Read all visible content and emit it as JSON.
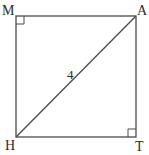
{
  "diagram": {
    "type": "geometry-square-with-diagonal",
    "vertices": [
      {
        "name": "M",
        "label": "M",
        "x": 16,
        "y": 16,
        "label_x": 3,
        "label_y": 15
      },
      {
        "name": "A",
        "label": "A",
        "x": 136,
        "y": 16,
        "label_x": 138,
        "label_y": 15
      },
      {
        "name": "H",
        "label": "H",
        "x": 16,
        "y": 137,
        "label_x": 5,
        "label_y": 150
      },
      {
        "name": "T",
        "label": "T",
        "x": 136,
        "y": 137,
        "label_x": 136,
        "label_y": 151
      }
    ],
    "sides": [
      "MA",
      "AT",
      "TH",
      "HM"
    ],
    "diagonal": {
      "from": "H",
      "to": "A",
      "length_label": "4",
      "label_x": 67,
      "label_y": 79
    },
    "right_angle_markers": [
      {
        "at": "M",
        "x": 16,
        "y": 16,
        "size": 8,
        "corner": "top-left"
      },
      {
        "at": "T",
        "x": 136,
        "y": 137,
        "size": 8,
        "corner": "bottom-right"
      }
    ],
    "stroke_color": "#4a4a4a",
    "text_color": "#2a2a2a"
  }
}
